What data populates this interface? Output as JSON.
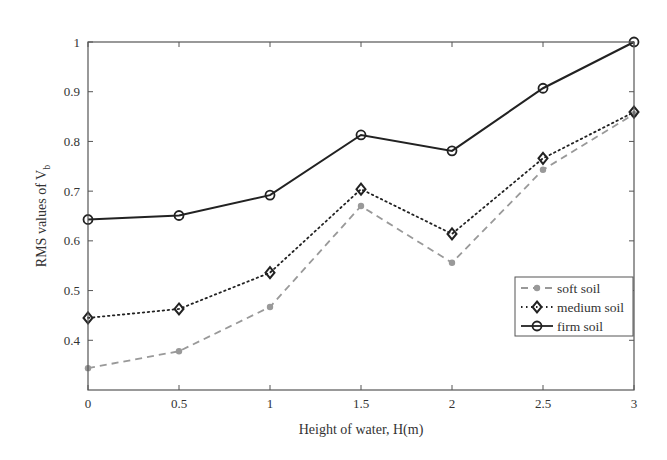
{
  "chart_data": {
    "type": "line",
    "title": "",
    "xlabel": "Height of water, H(m)",
    "ylabel": "RMS values of V",
    "ylabel_subscript": "b",
    "xlim": [
      0,
      3
    ],
    "ylim": [
      0.3,
      1.0
    ],
    "xticks": [
      0,
      0.5,
      1,
      1.5,
      2,
      2.5,
      3
    ],
    "xtick_labels": [
      "0",
      "0.5",
      "1",
      "1.5",
      "2",
      "2.5",
      "3"
    ],
    "yticks": [
      0.4,
      0.5,
      0.6,
      0.7,
      0.8,
      0.9,
      1.0
    ],
    "ytick_labels": [
      "0.4",
      "0.5",
      "0.6",
      "0.7",
      "0.8",
      "0.9",
      "1"
    ],
    "grid": false,
    "legend_position": "lower-right",
    "x": [
      0,
      0.5,
      1,
      1.5,
      2,
      2.5,
      3
    ],
    "series": [
      {
        "name": "soft soil",
        "style": "dashed",
        "marker": "asterisk",
        "color": "#999999",
        "values": [
          0.344,
          0.378,
          0.467,
          0.67,
          0.556,
          0.743,
          0.855
        ]
      },
      {
        "name": "medium soil",
        "style": "dotted",
        "marker": "diamond",
        "color": "#222222",
        "values": [
          0.445,
          0.463,
          0.536,
          0.704,
          0.614,
          0.766,
          0.859
        ]
      },
      {
        "name": "firm soil",
        "style": "solid",
        "marker": "circle",
        "color": "#222222",
        "values": [
          0.643,
          0.651,
          0.692,
          0.813,
          0.781,
          0.907,
          1.0
        ]
      }
    ]
  }
}
